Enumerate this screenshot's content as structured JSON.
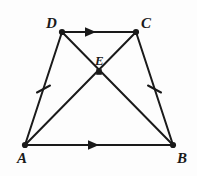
{
  "figure": {
    "type": "geometry-diagram",
    "shape": "isosceles-trapezoid-with-diagonals",
    "background_color": "#fdfdfd",
    "stroke_color": "#1a1a1a",
    "stroke_width": 2,
    "width": 197,
    "height": 176
  },
  "points": {
    "A": {
      "label": "A",
      "x": 25,
      "y": 145
    },
    "B": {
      "label": "B",
      "x": 173,
      "y": 145
    },
    "C": {
      "label": "C",
      "x": 136,
      "y": 32
    },
    "D": {
      "label": "D",
      "x": 62,
      "y": 32
    },
    "E": {
      "label": "E",
      "x": 99,
      "y": 72
    }
  },
  "segments": [
    {
      "name": "DC",
      "from": "D",
      "to": "C",
      "marker": "single-arrow",
      "marker_position": 0.42
    },
    {
      "name": "AB",
      "from": "A",
      "to": "B",
      "marker": "single-arrow",
      "marker_position": 0.45
    },
    {
      "name": "AD",
      "from": "A",
      "to": "D",
      "marker": "single-tick",
      "marker_position": 0.5
    },
    {
      "name": "BC",
      "from": "B",
      "to": "C",
      "marker": "single-tick",
      "marker_position": 0.5
    },
    {
      "name": "DB",
      "from": "D",
      "to": "B",
      "marker": "none",
      "marker_position": 0
    },
    {
      "name": "CA",
      "from": "C",
      "to": "A",
      "marker": "none",
      "marker_position": 0
    }
  ],
  "markings": {
    "arrow_note": "single arrowheads on DC and AB indicate the two sides are parallel",
    "tick_note": "single tick marks on AD and BC indicate the two legs are congruent"
  }
}
